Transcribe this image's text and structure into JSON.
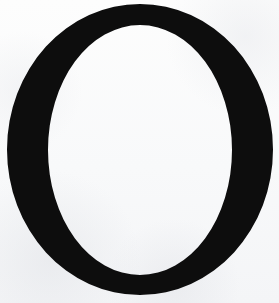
{
  "canvas": {
    "width": 279,
    "height": 303,
    "background_color": "#fcfcfc"
  },
  "glyph": {
    "character": "O",
    "name": "latin-capital-letter-o",
    "description": "Large black capital letter O",
    "color": "#0d0d0d",
    "outer": {
      "cx": 140,
      "cy": 149.5,
      "rx": 133,
      "ry": 145.5
    },
    "counter": {
      "cx": 140,
      "cy": 150,
      "rx": 92,
      "ry": 125
    },
    "metrics": {
      "outer_left": 7,
      "outer_right": 273,
      "outer_top": 4,
      "outer_bottom": 295,
      "counter_left": 48,
      "counter_right": 232,
      "counter_top": 25,
      "counter_bottom": 275,
      "side_stroke_width": 41,
      "top_stroke_width": 21,
      "bottom_stroke_width": 20,
      "stress": "vertical"
    }
  }
}
